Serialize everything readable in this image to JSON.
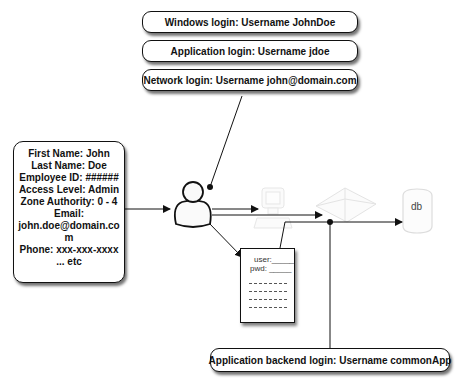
{
  "diagram": {
    "login_boxes": [
      {
        "label": "Windows login: Username JohnDoe"
      },
      {
        "label": "Application login: Username jdoe"
      },
      {
        "label": "Network login: Username john@domain.com"
      }
    ],
    "user_profile": {
      "lines": [
        "First Name: John",
        "Last Name: Doe",
        "Employee ID: ######",
        "Access Level: Admin",
        "Zone Authority: 0 - 4",
        "Email:",
        "john.doe@domain.co",
        "m",
        "Phone: xxx-xxx-xxxx",
        "... etc"
      ]
    },
    "nodes": {
      "user_icon": "person-icon",
      "computer_icon": "computer-icon",
      "network_icon": "network-icon",
      "database": {
        "label": "db"
      }
    },
    "login_form": {
      "user_label": "user:",
      "pwd_label": "pwd:"
    },
    "backend_box": {
      "label": "Application backend login: Username commonApp"
    }
  }
}
